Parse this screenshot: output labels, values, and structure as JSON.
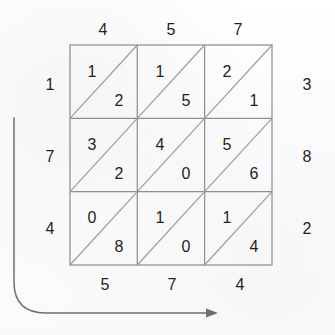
{
  "puzzle": {
    "type": "diagonal-split-grid",
    "rows": 3,
    "cols": 3,
    "grid": {
      "left": 70,
      "top": 45,
      "cell_width": 67.3,
      "cell_height": 73.3
    },
    "cells": [
      [
        {
          "upper": "1",
          "lower": "2"
        },
        {
          "upper": "1",
          "lower": "5"
        },
        {
          "upper": "2",
          "lower": "1"
        }
      ],
      [
        {
          "upper": "3",
          "lower": "2"
        },
        {
          "upper": "4",
          "lower": "0"
        },
        {
          "upper": "5",
          "lower": "6"
        }
      ],
      [
        {
          "upper": "0",
          "lower": "8"
        },
        {
          "upper": "1",
          "lower": "0"
        },
        {
          "upper": "1",
          "lower": "4"
        }
      ]
    ],
    "labels": {
      "top": [
        "4",
        "5",
        "7"
      ],
      "bottom": [
        "5",
        "7",
        "4"
      ],
      "left": [
        "1",
        "7",
        "4"
      ],
      "right": [
        "3",
        "8",
        "2"
      ]
    },
    "arrow": {
      "name": "curved-arrow",
      "direction": "down-then-right",
      "start": {
        "x": 14,
        "y": 118
      },
      "end": {
        "x": 218,
        "y": 313
      }
    },
    "colors": {
      "background": "#fdfdfd",
      "grid_line": "#8f8f95",
      "diagonal_line": "#9a9aa0",
      "text": "#1f1f22",
      "arrow": "#6d6d73"
    }
  }
}
